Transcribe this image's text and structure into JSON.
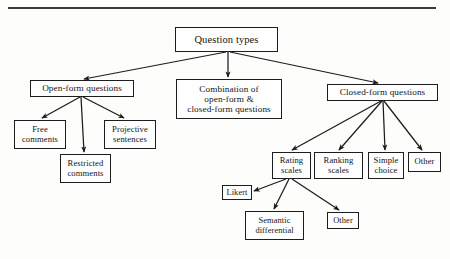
{
  "page": {
    "kind": "scanned-figure",
    "figure_title": "Question types hierarchy",
    "ink_color": "#1d1d1d",
    "paper_color": "#fdfdfc"
  },
  "divider": {
    "name": "top-horizontal-rule"
  },
  "nodes": {
    "question_types": {
      "label": "Question types",
      "lines": [
        "Question types"
      ],
      "x": 175,
      "y": 27,
      "w": 103,
      "h": 25,
      "level": 1
    },
    "open_form": {
      "label": "Open-form questions",
      "lines": [
        "Open-form questions"
      ],
      "x": 30,
      "y": 80,
      "w": 104,
      "h": 17,
      "level": 2
    },
    "combination": {
      "label": "Combination of open-form & closed-form questions",
      "lines": [
        "Combination of",
        "open-form &",
        "closed-form questions"
      ],
      "x": 176,
      "y": 79,
      "w": 106,
      "h": 40,
      "level": 2
    },
    "closed_form": {
      "label": "Closed-form questions",
      "lines": [
        "Closed-form questions"
      ],
      "x": 327,
      "y": 84,
      "w": 111,
      "h": 17,
      "level": 2
    },
    "free_comments": {
      "label": "Free comments",
      "lines": [
        "Free",
        "comments"
      ],
      "x": 14,
      "y": 120,
      "w": 52,
      "h": 29,
      "level": 3
    },
    "restricted_comments": {
      "label": "Restricted comments",
      "lines": [
        "Restricted",
        "comments"
      ],
      "x": 60,
      "y": 154,
      "w": 51,
      "h": 29,
      "level": 3
    },
    "projective_sentences": {
      "label": "Projective sentences",
      "lines": [
        "Projective",
        "sentences"
      ],
      "x": 104,
      "y": 120,
      "w": 52,
      "h": 29,
      "level": 3
    },
    "rating_scales": {
      "label": "Rating scales",
      "lines": [
        "Rating",
        "scales"
      ],
      "x": 272,
      "y": 152,
      "w": 39,
      "h": 27,
      "level": 3
    },
    "ranking_scales": {
      "label": "Ranking scales",
      "lines": [
        "Ranking",
        "scales"
      ],
      "x": 314,
      "y": 152,
      "w": 49,
      "h": 27,
      "level": 3
    },
    "simple_choice": {
      "label": "Simple choice",
      "lines": [
        "Simple",
        "choice"
      ],
      "x": 368,
      "y": 152,
      "w": 36,
      "h": 27,
      "level": 3
    },
    "other_closed": {
      "label": "Other",
      "lines": [
        "Other"
      ],
      "x": 408,
      "y": 152,
      "w": 33,
      "h": 20,
      "level": 3
    },
    "likert": {
      "label": "Likert",
      "lines": [
        "Likert"
      ],
      "x": 222,
      "y": 185,
      "w": 30,
      "h": 15,
      "level": 4
    },
    "semantic_differential": {
      "label": "Semantic differential",
      "lines": [
        "Semantic",
        "differential"
      ],
      "x": 245,
      "y": 211,
      "w": 59,
      "h": 29,
      "level": 4
    },
    "other_rating": {
      "label": "Other",
      "lines": [
        "Other"
      ],
      "x": 327,
      "y": 212,
      "w": 32,
      "h": 17,
      "level": 4
    }
  },
  "edges": [
    {
      "name": "edge-question-types-to-open-form",
      "from": "question_types",
      "to": "open_form",
      "x1": 226,
      "y1": 52,
      "x2": 84,
      "y2": 79
    },
    {
      "name": "edge-question-types-to-combination",
      "from": "question_types",
      "to": "combination",
      "x1": 228,
      "y1": 52,
      "x2": 228,
      "y2": 77
    },
    {
      "name": "edge-question-types-to-closed-form",
      "from": "question_types",
      "to": "closed_form",
      "x1": 230,
      "y1": 52,
      "x2": 378,
      "y2": 83
    },
    {
      "name": "edge-open-form-to-free-comments",
      "from": "open_form",
      "to": "free_comments",
      "x1": 80,
      "y1": 97,
      "x2": 42,
      "y2": 118
    },
    {
      "name": "edge-open-form-to-restricted",
      "from": "open_form",
      "to": "restricted_comments",
      "x1": 81,
      "y1": 97,
      "x2": 84,
      "y2": 152
    },
    {
      "name": "edge-open-form-to-projective",
      "from": "open_form",
      "to": "projective_sentences",
      "x1": 83,
      "y1": 97,
      "x2": 124,
      "y2": 118
    },
    {
      "name": "edge-closed-form-to-rating",
      "from": "closed_form",
      "to": "rating_scales",
      "x1": 381,
      "y1": 101,
      "x2": 292,
      "y2": 150
    },
    {
      "name": "edge-closed-form-to-ranking",
      "from": "closed_form",
      "to": "ranking_scales",
      "x1": 382,
      "y1": 101,
      "x2": 339,
      "y2": 150
    },
    {
      "name": "edge-closed-form-to-simple-choice",
      "from": "closed_form",
      "to": "simple_choice",
      "x1": 383,
      "y1": 101,
      "x2": 385,
      "y2": 150
    },
    {
      "name": "edge-closed-form-to-other",
      "from": "closed_form",
      "to": "other_closed",
      "x1": 384,
      "y1": 101,
      "x2": 422,
      "y2": 150
    },
    {
      "name": "edge-rating-to-likert",
      "from": "rating_scales",
      "to": "likert",
      "x1": 286,
      "y1": 179,
      "x2": 254,
      "y2": 191
    },
    {
      "name": "edge-rating-to-semantic",
      "from": "rating_scales",
      "to": "semantic_differential",
      "x1": 289,
      "y1": 179,
      "x2": 274,
      "y2": 209
    },
    {
      "name": "edge-rating-to-other",
      "from": "rating_scales",
      "to": "other_rating",
      "x1": 292,
      "y1": 179,
      "x2": 339,
      "y2": 210
    }
  ]
}
